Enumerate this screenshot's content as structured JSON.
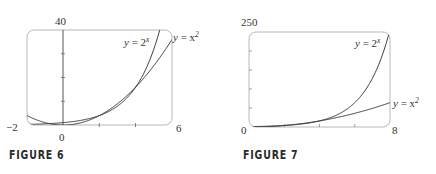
{
  "figures": [
    {
      "caption": "FIGURE 6",
      "x_min_label": "−2",
      "x_max_label": "6",
      "y_max_label": "40",
      "origin_label": "0",
      "curve1_label": {
        "y": "y",
        "eq": " = 2",
        "sup": "x"
      },
      "curve2_label": {
        "y": "y",
        "eq": " = x",
        "sup": "2"
      }
    },
    {
      "caption": "FIGURE 7",
      "x_min_label": "0",
      "x_max_label": "8",
      "y_max_label": "250",
      "curve1_label": {
        "y": "y",
        "eq": " = 2",
        "sup": "x"
      },
      "curve2_label": {
        "y": "y",
        "eq": " = x",
        "sup": "2"
      }
    }
  ],
  "chart_data": [
    {
      "type": "line",
      "title": "FIGURE 6",
      "xlim": [
        -2,
        6
      ],
      "ylim": [
        0,
        40
      ],
      "x_ticks": [
        -2,
        0,
        2,
        4,
        6
      ],
      "y_ticks": [
        0,
        10,
        20,
        30,
        40
      ],
      "tick_labels": {
        "x": [
          "−2",
          "0",
          "6"
        ],
        "y": [
          "40"
        ]
      },
      "grid": false,
      "series": [
        {
          "name": "y = 2^x",
          "function": "2^x",
          "x": [
            -2,
            -1,
            0,
            1,
            2,
            3,
            4,
            5,
            5.32
          ],
          "y": [
            0.25,
            0.5,
            1,
            2,
            4,
            8,
            16,
            32,
            40
          ]
        },
        {
          "name": "y = x^2",
          "function": "x^2",
          "x": [
            -2,
            -1,
            0,
            1,
            2,
            3,
            4,
            5,
            6
          ],
          "y": [
            4,
            1,
            0,
            1,
            4,
            9,
            16,
            25,
            36
          ]
        }
      ],
      "annotations": [
        "y = 2^x",
        "y = x^2"
      ]
    },
    {
      "type": "line",
      "title": "FIGURE 7",
      "xlim": [
        0,
        8
      ],
      "ylim": [
        0,
        250
      ],
      "x_ticks": [
        0,
        2,
        4,
        6,
        8
      ],
      "y_ticks": [
        0,
        50,
        100,
        150,
        200,
        250
      ],
      "tick_labels": {
        "x": [
          "0",
          "8"
        ],
        "y": [
          "250"
        ]
      },
      "grid": false,
      "series": [
        {
          "name": "y = 2^x",
          "function": "2^x",
          "x": [
            0,
            1,
            2,
            3,
            4,
            5,
            6,
            7,
            7.97
          ],
          "y": [
            1,
            2,
            4,
            8,
            16,
            32,
            64,
            128,
            250
          ]
        },
        {
          "name": "y = x^2",
          "function": "x^2",
          "x": [
            0,
            1,
            2,
            3,
            4,
            5,
            6,
            7,
            8
          ],
          "y": [
            0,
            1,
            4,
            9,
            16,
            25,
            36,
            49,
            64
          ]
        }
      ],
      "annotations": [
        "y = 2^x",
        "y = x^2"
      ]
    }
  ]
}
